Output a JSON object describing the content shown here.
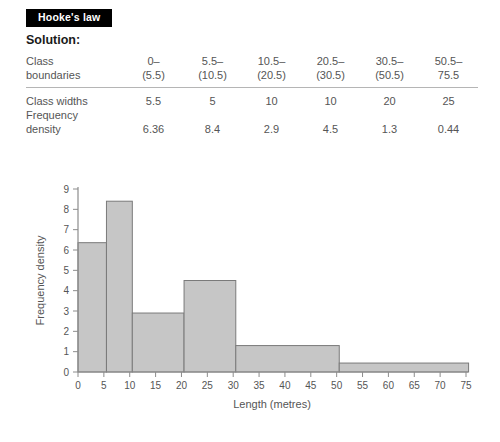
{
  "banner": {
    "title": "Hooke's law"
  },
  "heading": {
    "solution": "Solution:"
  },
  "table": {
    "rows": [
      {
        "label_line1": "Class",
        "label_line2": "boundaries",
        "values_top": [
          "0–",
          "5.5–",
          "10.5–",
          "20.5–",
          "30.5–",
          "50.5–"
        ],
        "values_bottom": [
          "(5.5)",
          "(10.5)",
          "(20.5)",
          "(30.5)",
          "(50.5)",
          "75.5"
        ]
      },
      {
        "label": "Class widths",
        "values": [
          "5.5",
          "5",
          "10",
          "10",
          "20",
          "25"
        ]
      },
      {
        "label_line1": "Frequency",
        "label_line2": "density",
        "values": [
          "6.36",
          "8.4",
          "2.9",
          "4.5",
          "1.3",
          "0.44"
        ]
      }
    ]
  },
  "chart_data": {
    "type": "bar",
    "title": "",
    "xlabel": "Length (metres)",
    "ylabel": "Frequency density",
    "xlim": [
      0,
      75
    ],
    "ylim": [
      0,
      9
    ],
    "xticks": [
      0,
      5,
      10,
      15,
      20,
      25,
      30,
      35,
      40,
      45,
      50,
      55,
      60,
      65,
      70,
      75
    ],
    "yticks": [
      0,
      1,
      2,
      3,
      4,
      5,
      6,
      7,
      8,
      9
    ],
    "grid": false,
    "legend": false,
    "bar_fill": "#c6c6c6",
    "bar_stroke": "#7a7a7a",
    "axis_color": "#8c8c8c",
    "bins": [
      {
        "start": 0,
        "end": 5.5,
        "width": 5.5,
        "value": 6.36
      },
      {
        "start": 5.5,
        "end": 10.5,
        "width": 5,
        "value": 8.4
      },
      {
        "start": 10.5,
        "end": 20.5,
        "width": 10,
        "value": 2.9
      },
      {
        "start": 20.5,
        "end": 30.5,
        "width": 10,
        "value": 4.5
      },
      {
        "start": 30.5,
        "end": 50.5,
        "width": 20,
        "value": 1.3
      },
      {
        "start": 50.5,
        "end": 75.5,
        "width": 25,
        "value": 0.44
      }
    ]
  }
}
